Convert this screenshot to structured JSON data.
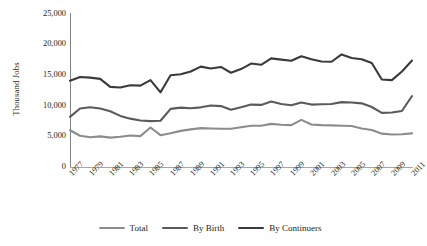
{
  "chart_data": {
    "type": "line",
    "title": "",
    "xlabel": "",
    "ylabel": "Thousand Jobs",
    "ylim": [
      0,
      25000
    ],
    "yticks": [
      "0",
      "5,000",
      "10,000",
      "15,000",
      "20,000",
      "25,000"
    ],
    "ytick_values": [
      0,
      5000,
      10000,
      15000,
      20000,
      25000
    ],
    "grid": false,
    "legend_position": "bottom",
    "x": [
      1977,
      1978,
      1979,
      1980,
      1981,
      1982,
      1983,
      1984,
      1985,
      1986,
      1987,
      1988,
      1989,
      1990,
      1991,
      1992,
      1993,
      1994,
      1995,
      1996,
      1997,
      1998,
      1999,
      2000,
      2001,
      2002,
      2003,
      2004,
      2005,
      2006,
      2007,
      2008,
      2009,
      2010,
      2011
    ],
    "xtick_labels": [
      "1977",
      "1979",
      "1981",
      "1983",
      "1985",
      "1987",
      "1989",
      "1991",
      "1993",
      "1995",
      "1997",
      "1999",
      "2001",
      "2003",
      "2005",
      "2007",
      "2009",
      "2011"
    ],
    "series": [
      {
        "name": "Total",
        "color": "#8c8c8c",
        "values": [
          6000,
          5100,
          4850,
          5000,
          4800,
          4950,
          5150,
          5050,
          6450,
          5200,
          5500,
          5900,
          6150,
          6350,
          6300,
          6250,
          6250,
          6500,
          6750,
          6750,
          7050,
          6900,
          6850,
          7700,
          6950,
          6850,
          6800,
          6750,
          6700,
          6300,
          6050,
          5450,
          5300,
          5350,
          5500
        ]
      },
      {
        "name": "By Birth",
        "color": "#5a5a5a",
        "values": [
          8200,
          9550,
          9750,
          9550,
          9100,
          8350,
          7900,
          7600,
          7500,
          7550,
          9500,
          9700,
          9600,
          9750,
          10050,
          9950,
          9350,
          9750,
          10200,
          10150,
          10700,
          10300,
          10100,
          10550,
          10200,
          10250,
          10300,
          10600,
          10550,
          10400,
          9800,
          8850,
          8900,
          9150,
          11600
        ]
      },
      {
        "name": "By Continuers",
        "color": "#3a3a3a",
        "values": [
          14100,
          14700,
          14600,
          14400,
          13100,
          13000,
          13350,
          13300,
          14200,
          12200,
          15000,
          15150,
          15600,
          16400,
          16100,
          16350,
          15400,
          16000,
          16900,
          16700,
          17750,
          17550,
          17350,
          18100,
          17600,
          17250,
          17200,
          18400,
          17800,
          17600,
          17000,
          14300,
          14200,
          15600,
          17400
        ]
      }
    ]
  },
  "legend": {
    "items": [
      {
        "label": "Total"
      },
      {
        "label": "By Birth"
      },
      {
        "label": "By Continuers"
      }
    ]
  }
}
